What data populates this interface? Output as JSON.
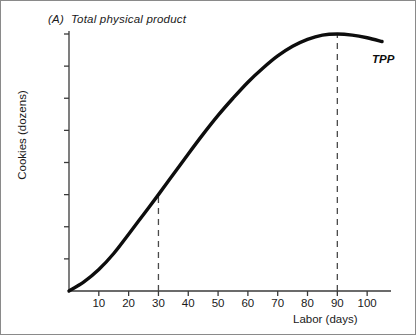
{
  "figure": {
    "panel_letter": "(A)",
    "title": "Total physical product",
    "curve_label": "TPP",
    "frame_color": "#8a8a8a",
    "curve_color": "#0d0d0d",
    "axis_color": "#3a3a3a",
    "dash_color": "#4a4a4a"
  },
  "chart_data": {
    "type": "line",
    "xlabel": "Labor (days)",
    "ylabel": "Cookies (dozens)",
    "xlim": [
      0,
      108
    ],
    "ylim": [
      0,
      4800
    ],
    "grid": false,
    "legend": "none",
    "xticks": [
      10,
      20,
      30,
      40,
      50,
      60,
      70,
      80,
      90,
      100
    ],
    "xtick_labels": [
      "10",
      "20",
      "30",
      "40",
      "50",
      "60",
      "70",
      "80",
      "90",
      "100"
    ],
    "yticks": [
      0,
      600,
      1200,
      1800,
      2400,
      3000,
      3600,
      4200,
      4800
    ],
    "ytick_labels": [
      "0",
      "600",
      "1,200",
      "1,800",
      "2,400",
      "3,000",
      "3,600",
      "4,200",
      "4,800"
    ],
    "series": [
      {
        "name": "TPP",
        "label": "TPP",
        "x": [
          0,
          5,
          10,
          15,
          20,
          25,
          30,
          35,
          40,
          45,
          50,
          55,
          60,
          65,
          70,
          75,
          80,
          85,
          90,
          95,
          100,
          105
        ],
        "values": [
          0,
          170,
          400,
          700,
          1060,
          1430,
          1800,
          2180,
          2560,
          2930,
          3280,
          3600,
          3900,
          4160,
          4390,
          4570,
          4700,
          4780,
          4800,
          4780,
          4730,
          4660
        ]
      }
    ],
    "annotations": [
      {
        "name": "dashed-line-30",
        "type": "vline",
        "x": 30,
        "y_from": 0,
        "y_to": 1800
      },
      {
        "name": "dashed-line-90",
        "type": "vline",
        "x": 90,
        "y_from": 0,
        "y_to": 4800
      }
    ]
  }
}
